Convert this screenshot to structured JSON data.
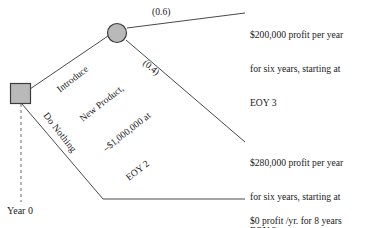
{
  "diagram": {
    "type": "decision-tree",
    "colors": {
      "node_fill": "#b9b9b9",
      "node_stroke": "#3d3d3d",
      "line": "#4a4a4a",
      "text": "#1a1a1a"
    },
    "decision_node": {
      "shape": "square",
      "name": "decision-node"
    },
    "chance_node": {
      "shape": "circle",
      "name": "chance-node"
    },
    "timeline": {
      "year_label": "Year 0"
    },
    "branches": {
      "introduce": {
        "line1": "Introduce",
        "line2": "New Product,",
        "line3": "–$1,000,000 at",
        "line4": "EOY 2"
      },
      "do_nothing": {
        "label": "Do Nothing"
      }
    },
    "probabilities": {
      "upper": "(0.6)",
      "lower": "(0.4)"
    },
    "outcomes": {
      "top": {
        "line1": "$200,000 profit per year",
        "line2": "for six years, starting at",
        "line3": "EOY 3"
      },
      "middle": {
        "line1": "$280,000 profit per year",
        "line2": "for six years, starting at",
        "line3": "EOY 3"
      },
      "bottom": {
        "line1": "$0 profit /yr. for 8 years"
      }
    }
  }
}
